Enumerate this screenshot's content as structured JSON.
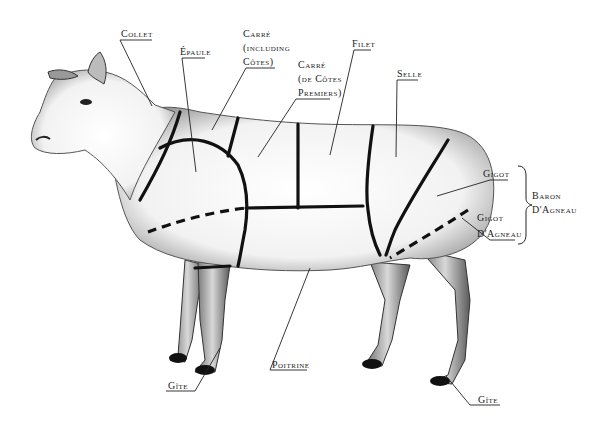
{
  "diagram": {
    "labels": {
      "collet": "Collet",
      "epaule": "Épaule",
      "carre_including_1": "Carré",
      "carre_including_2": "(including",
      "carre_including_3": "Côtes)",
      "carre_premiers_1": "Carré",
      "carre_premiers_2": "(de Côtes",
      "carre_premiers_3": "Premiers)",
      "filet": "Filet",
      "selle": "Selle",
      "gigot": "Gigot",
      "gigot_dagneau_1": "Gigot",
      "gigot_dagneau_2": "D'Agneau",
      "baron_1": "Baron",
      "baron_2": "D'Agneau",
      "poitrine": "Poitrine",
      "gite_front": "Gîte",
      "gite_rear": "Gîte"
    },
    "groupings": [
      {
        "bracket": "Baron D'Agneau",
        "includes": [
          "Gigot",
          "Gigot D'Agneau"
        ]
      }
    ]
  }
}
